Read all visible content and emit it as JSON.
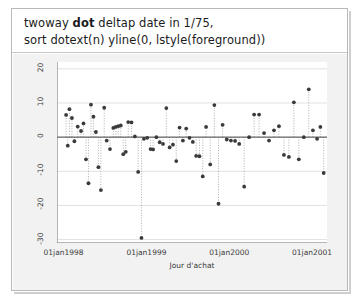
{
  "command": {
    "line1_pre": "twoway ",
    "line1_bold": "dot",
    "line1_post": " deltap date in 1/75,",
    "line2": "sort dotext(n) yline(0, lstyle(foreground))"
  },
  "chart_data": {
    "type": "scatter",
    "title": "",
    "xlabel": "Jour d'achat",
    "ylabel": "Ecart au prix d'achat",
    "grid": true,
    "legend": "none",
    "yticks": [
      20,
      10,
      0,
      -10,
      -20,
      -30
    ],
    "ytick_labels": [
      "20",
      "10",
      "0",
      "-10",
      "-20",
      "-30"
    ],
    "ylim": [
      -31,
      22
    ],
    "xticks": [
      0,
      1,
      2,
      3
    ],
    "xtick_labels": [
      "01jan1998",
      "01jan1999",
      "01jan2000",
      "01jan2001"
    ],
    "xlim": [
      -0.08,
      3.18
    ],
    "zero_line": 0,
    "marker_color": "#3a3a3a",
    "stem_color": "#9a9a9a",
    "grid_color": "#e2e2e2",
    "axis_color": "#6d6d6d",
    "plot_background": "#ffffff",
    "graph_background": "#f2f2f2",
    "x": [
      0.03,
      0.05,
      0.07,
      0.1,
      0.13,
      0.17,
      0.21,
      0.24,
      0.27,
      0.3,
      0.33,
      0.36,
      0.39,
      0.42,
      0.45,
      0.49,
      0.52,
      0.56,
      0.6,
      0.63,
      0.66,
      0.69,
      0.72,
      0.75,
      0.78,
      0.82,
      0.86,
      0.9,
      0.94,
      0.97,
      1.01,
      1.05,
      1.08,
      1.12,
      1.16,
      1.2,
      1.24,
      1.28,
      1.32,
      1.36,
      1.4,
      1.44,
      1.48,
      1.52,
      1.56,
      1.6,
      1.64,
      1.68,
      1.72,
      1.77,
      1.82,
      1.87,
      1.92,
      1.97,
      2.02,
      2.07,
      2.12,
      2.18,
      2.24,
      2.3,
      2.36,
      2.42,
      2.48,
      2.54,
      2.6,
      2.66,
      2.72,
      2.78,
      2.84,
      2.9,
      2.96,
      3.01,
      3.06,
      3.1,
      3.14
    ],
    "y": [
      6.5,
      -2.5,
      8.2,
      5.6,
      -1.2,
      3.1,
      1.8,
      4.0,
      -6.5,
      -13.5,
      9.5,
      6.0,
      1.5,
      -8.8,
      -15.5,
      8.6,
      -1.0,
      -3.5,
      2.7,
      3.0,
      3.2,
      3.4,
      -5.0,
      -4.3,
      4.4,
      4.3,
      0.2,
      -10.2,
      -29.5,
      -0.5,
      -0.2,
      -3.5,
      -3.6,
      0.0,
      -1.5,
      -2.0,
      8.5,
      -3.0,
      -2.2,
      -7.0,
      2.8,
      -1.0,
      2.5,
      -0.2,
      -1.4,
      -5.5,
      -5.6,
      -11.5,
      3.0,
      -8.0,
      9.4,
      -19.5,
      3.6,
      -0.7,
      -1.0,
      -1.1,
      -2.0,
      -14.5,
      0.0,
      6.6,
      6.6,
      1.2,
      -1.0,
      2.0,
      3.2,
      -5.2,
      -5.8,
      10.2,
      -6.5,
      0.0,
      14.0,
      2.0,
      -0.5,
      3.0,
      -10.5
    ]
  }
}
